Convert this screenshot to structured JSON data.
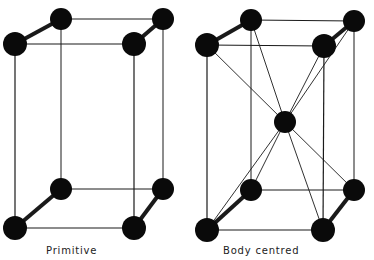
{
  "diagram": {
    "colors": {
      "atom": "#0a0a0a",
      "edge": "#1a1a1a",
      "background": "#ffffff"
    },
    "cells": [
      {
        "name": "primitive",
        "label": "Primitive",
        "atoms": {
          "top_back_left": [
            61,
            19
          ],
          "top_back_right": [
            163,
            19
          ],
          "top_front_left": [
            15,
            44
          ],
          "top_front_right": [
            134,
            44
          ],
          "bottom_back_left": [
            61,
            189
          ],
          "bottom_back_right": [
            163,
            189
          ],
          "bottom_front_left": [
            15,
            228
          ],
          "bottom_front_right": [
            134,
            228
          ]
        }
      },
      {
        "name": "body-centred",
        "label": "Body centred",
        "atoms": {
          "top_back_left": [
            251,
            20
          ],
          "top_back_right": [
            354,
            21
          ],
          "top_front_left": [
            207,
            45
          ],
          "top_front_right": [
            324,
            46
          ],
          "center": [
            285,
            122
          ],
          "bottom_back_left": [
            251,
            190
          ],
          "bottom_back_right": [
            354,
            190
          ],
          "bottom_front_left": [
            207,
            230
          ],
          "bottom_front_right": [
            323,
            230
          ]
        }
      }
    ]
  }
}
